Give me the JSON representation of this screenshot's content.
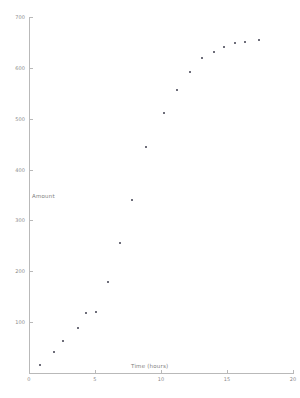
{
  "chart_data": {
    "type": "scatter",
    "title": "",
    "xlabel": "Time (hours)",
    "ylabel": "Amount",
    "xlim": [
      0,
      20
    ],
    "ylim": [
      0,
      700
    ],
    "grid": false,
    "legend": null,
    "x_ticks": [
      "0",
      "5",
      "10",
      "15",
      "20"
    ],
    "x_tick_values": [
      0,
      5,
      10,
      15,
      20
    ],
    "y_ticks": [
      "100",
      "200",
      "300",
      "400",
      "500",
      "600",
      "700"
    ],
    "y_tick_values": [
      100,
      200,
      300,
      400,
      500,
      600,
      700
    ],
    "marker": "point",
    "marker_color": "#6e6e7a",
    "axis_color": "#b9b9b9",
    "points": [
      {
        "x": 0.8,
        "y": 15
      },
      {
        "x": 1.9,
        "y": 42
      },
      {
        "x": 2.6,
        "y": 62
      },
      {
        "x": 3.7,
        "y": 88
      },
      {
        "x": 4.3,
        "y": 118
      },
      {
        "x": 5.1,
        "y": 120
      },
      {
        "x": 6.0,
        "y": 178
      },
      {
        "x": 6.9,
        "y": 255
      },
      {
        "x": 7.8,
        "y": 340
      },
      {
        "x": 8.9,
        "y": 445
      },
      {
        "x": 10.2,
        "y": 512
      },
      {
        "x": 11.2,
        "y": 557
      },
      {
        "x": 12.2,
        "y": 592
      },
      {
        "x": 13.1,
        "y": 620
      },
      {
        "x": 14.0,
        "y": 632
      },
      {
        "x": 14.8,
        "y": 641
      },
      {
        "x": 15.6,
        "y": 648
      },
      {
        "x": 16.4,
        "y": 650
      },
      {
        "x": 17.4,
        "y": 655
      }
    ]
  }
}
